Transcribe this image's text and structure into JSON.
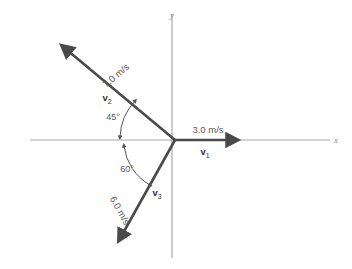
{
  "figure": {
    "axes": {
      "x_label": "x",
      "y_label": "y",
      "axis_color": "#a8a8a8"
    },
    "vector_color": "#4a4a4a",
    "vectors": [
      {
        "id": "v1",
        "name": "v",
        "subscript": "1",
        "magnitude_label": "3.0 m/s",
        "magnitude": 3.0,
        "unit": "m/s",
        "direction_deg": 0,
        "description": "along positive x axis"
      },
      {
        "id": "v2",
        "name": "v",
        "subscript": "2",
        "magnitude_label": "7.0 m/s",
        "magnitude": 7.0,
        "unit": "m/s",
        "direction_deg": 135,
        "description": "45 degrees above negative x axis"
      },
      {
        "id": "v3",
        "name": "v",
        "subscript": "3",
        "magnitude_label": "6.0 m/s",
        "magnitude": 6.0,
        "unit": "m/s",
        "direction_deg": 240,
        "description": "60 degrees below negative x axis"
      }
    ],
    "angles": [
      {
        "id": "angle-45",
        "label": "45°",
        "value": 45,
        "from": "negative-x-axis",
        "to": "v2"
      },
      {
        "id": "angle-60",
        "label": "60°",
        "value": 60,
        "from": "negative-x-axis",
        "to": "v3"
      }
    ]
  }
}
